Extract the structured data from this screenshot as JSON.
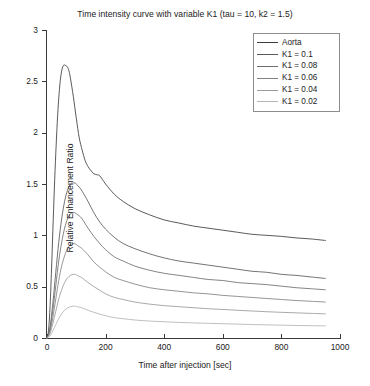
{
  "chart_data": {
    "type": "line",
    "title": "Time intensity curve with variable K1 (tau = 10, k2 = 1.5)",
    "xlabel": "Time after injection [sec]",
    "ylabel": "Relative Enhancement Ratio",
    "xlim": [
      0,
      1000
    ],
    "ylim": [
      0,
      3
    ],
    "xticks": [
      0,
      200,
      400,
      600,
      800,
      1000
    ],
    "xtick_labels": [
      "0",
      "200",
      "400",
      "600",
      "800",
      "1000"
    ],
    "yticks": [
      0,
      0.5,
      1,
      1.5,
      2,
      2.5,
      3
    ],
    "ytick_labels": [
      "0",
      "0.5",
      "1",
      "1.5",
      "2",
      "2.5",
      "3"
    ],
    "grid": false,
    "legend_position": "top-right",
    "series": [
      {
        "name": "Aorta",
        "color": "#3c3c3c",
        "peak_time": 70,
        "peak_value": 2.65,
        "end_value": 0.95,
        "x": [
          0,
          5,
          10,
          15,
          20,
          25,
          30,
          35,
          40,
          45,
          50,
          55,
          60,
          65,
          70,
          75,
          80,
          90,
          100,
          110,
          120,
          130,
          140,
          150,
          160,
          170,
          180,
          200,
          230,
          260,
          300,
          350,
          400,
          450,
          500,
          550,
          600,
          650,
          700,
          750,
          800,
          850,
          900,
          950
        ],
        "y": [
          0,
          0.07,
          0.28,
          0.63,
          1.05,
          1.45,
          1.8,
          2.1,
          2.33,
          2.5,
          2.6,
          2.65,
          2.66,
          2.65,
          2.64,
          2.6,
          2.53,
          2.35,
          2.14,
          1.95,
          1.83,
          1.73,
          1.67,
          1.63,
          1.6,
          1.59,
          1.58,
          1.5,
          1.4,
          1.33,
          1.26,
          1.2,
          1.15,
          1.12,
          1.09,
          1.07,
          1.05,
          1.03,
          1.01,
          1.0,
          0.99,
          0.975,
          0.965,
          0.95
        ]
      },
      {
        "name": "K1 = 0.1",
        "color": "#5a5a5a",
        "peak_time": 95,
        "peak_value": 1.51,
        "end_value": 0.58,
        "x": [
          0,
          10,
          20,
          30,
          40,
          50,
          60,
          70,
          80,
          90,
          95,
          100,
          110,
          120,
          140,
          160,
          180,
          200,
          230,
          260,
          300,
          350,
          400,
          450,
          500,
          550,
          600,
          650,
          700,
          750,
          800,
          850,
          900,
          950
        ],
        "y": [
          0,
          0.1,
          0.34,
          0.64,
          0.93,
          1.16,
          1.33,
          1.44,
          1.5,
          1.51,
          1.51,
          1.5,
          1.47,
          1.43,
          1.33,
          1.22,
          1.13,
          1.06,
          0.98,
          0.92,
          0.87,
          0.82,
          0.78,
          0.75,
          0.73,
          0.71,
          0.69,
          0.67,
          0.65,
          0.64,
          0.62,
          0.61,
          0.595,
          0.58
        ]
      },
      {
        "name": "K1 = 0.08",
        "color": "#6e6e6e",
        "peak_time": 95,
        "peak_value": 1.22,
        "end_value": 0.47,
        "x": [
          0,
          10,
          20,
          30,
          40,
          50,
          60,
          70,
          80,
          90,
          95,
          100,
          110,
          120,
          140,
          160,
          180,
          200,
          230,
          260,
          300,
          350,
          400,
          450,
          500,
          550,
          600,
          650,
          700,
          750,
          800,
          850,
          900,
          950
        ],
        "y": [
          0,
          0.08,
          0.27,
          0.51,
          0.75,
          0.93,
          1.07,
          1.16,
          1.21,
          1.22,
          1.22,
          1.21,
          1.19,
          1.16,
          1.07,
          0.99,
          0.92,
          0.86,
          0.79,
          0.75,
          0.7,
          0.66,
          0.63,
          0.61,
          0.59,
          0.57,
          0.56,
          0.54,
          0.53,
          0.52,
          0.505,
          0.49,
          0.48,
          0.47
        ]
      },
      {
        "name": "K1 = 0.06",
        "color": "#828282",
        "peak_time": 95,
        "peak_value": 0.92,
        "end_value": 0.35,
        "x": [
          0,
          10,
          20,
          30,
          40,
          50,
          60,
          70,
          80,
          90,
          95,
          100,
          110,
          120,
          140,
          160,
          180,
          200,
          230,
          260,
          300,
          350,
          400,
          450,
          500,
          550,
          600,
          650,
          700,
          750,
          800,
          850,
          900,
          950
        ],
        "y": [
          0,
          0.06,
          0.2,
          0.38,
          0.56,
          0.7,
          0.8,
          0.87,
          0.91,
          0.92,
          0.92,
          0.91,
          0.89,
          0.87,
          0.81,
          0.74,
          0.69,
          0.645,
          0.59,
          0.56,
          0.525,
          0.49,
          0.47,
          0.455,
          0.44,
          0.43,
          0.415,
          0.405,
          0.395,
          0.385,
          0.375,
          0.365,
          0.358,
          0.35
        ]
      },
      {
        "name": "K1 = 0.04",
        "color": "#9a9a9a",
        "peak_time": 95,
        "peak_value": 0.62,
        "end_value": 0.235,
        "x": [
          0,
          10,
          20,
          30,
          40,
          50,
          60,
          70,
          80,
          90,
          95,
          100,
          110,
          120,
          140,
          160,
          180,
          200,
          230,
          260,
          300,
          350,
          400,
          450,
          500,
          550,
          600,
          650,
          700,
          750,
          800,
          850,
          900,
          950
        ],
        "y": [
          0,
          0.04,
          0.14,
          0.26,
          0.38,
          0.47,
          0.54,
          0.585,
          0.61,
          0.62,
          0.62,
          0.615,
          0.6,
          0.585,
          0.54,
          0.5,
          0.465,
          0.43,
          0.395,
          0.375,
          0.35,
          0.33,
          0.315,
          0.305,
          0.295,
          0.285,
          0.278,
          0.27,
          0.263,
          0.256,
          0.25,
          0.245,
          0.24,
          0.235
        ]
      },
      {
        "name": "K1 = 0.02",
        "color": "#b4b4b4",
        "peak_time": 95,
        "peak_value": 0.31,
        "end_value": 0.118,
        "x": [
          0,
          10,
          20,
          30,
          40,
          50,
          60,
          70,
          80,
          90,
          95,
          100,
          110,
          120,
          140,
          160,
          180,
          200,
          230,
          260,
          300,
          350,
          400,
          450,
          500,
          550,
          600,
          650,
          700,
          750,
          800,
          850,
          900,
          950
        ],
        "y": [
          0,
          0.02,
          0.07,
          0.13,
          0.19,
          0.235,
          0.27,
          0.293,
          0.305,
          0.31,
          0.31,
          0.308,
          0.3,
          0.293,
          0.27,
          0.25,
          0.233,
          0.217,
          0.198,
          0.188,
          0.175,
          0.165,
          0.158,
          0.152,
          0.147,
          0.143,
          0.139,
          0.135,
          0.131,
          0.128,
          0.125,
          0.122,
          0.12,
          0.118
        ]
      }
    ]
  },
  "legend": {
    "entries": [
      {
        "label": "Aorta",
        "color": "#3c3c3c"
      },
      {
        "label": "K1 = 0.1",
        "color": "#5a5a5a"
      },
      {
        "label": "K1 = 0.08",
        "color": "#6e6e6e"
      },
      {
        "label": "K1 = 0.06",
        "color": "#828282"
      },
      {
        "label": "K1 = 0.04",
        "color": "#9a9a9a"
      },
      {
        "label": "K1 = 0.02",
        "color": "#b4b4b4"
      }
    ]
  },
  "axis_color": "#3a3a3a",
  "background_color": "#ffffff"
}
